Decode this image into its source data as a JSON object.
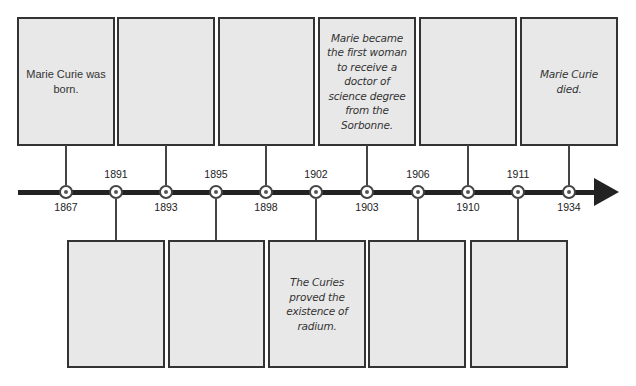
{
  "timeline": {
    "axis_color": "#222222",
    "box_fill": "#e8e8e8",
    "box_border": "#333333",
    "nodes": [
      {
        "year": "1867",
        "label_position": "below",
        "x": 66
      },
      {
        "year": "1891",
        "label_position": "above",
        "x": 116
      },
      {
        "year": "1893",
        "label_position": "below",
        "x": 166
      },
      {
        "year": "1895",
        "label_position": "above",
        "x": 216
      },
      {
        "year": "1898",
        "label_position": "below",
        "x": 266
      },
      {
        "year": "1902",
        "label_position": "above",
        "x": 316
      },
      {
        "year": "1903",
        "label_position": "below",
        "x": 367
      },
      {
        "year": "1906",
        "label_position": "above",
        "x": 418
      },
      {
        "year": "1910",
        "label_position": "below",
        "x": 468
      },
      {
        "year": "1911",
        "label_position": "above",
        "x": 518
      },
      {
        "year": "1934",
        "label_position": "below",
        "x": 569
      }
    ],
    "top_boxes": [
      {
        "year": "1867",
        "text": "Marie Curie was born.",
        "style": "print"
      },
      {
        "year": "1893",
        "text": "",
        "style": "print"
      },
      {
        "year": "1898",
        "text": "",
        "style": "print"
      },
      {
        "year": "1903",
        "text": "Marie became the first woman to receive a doctor of science degree from the Sorbonne.",
        "style": "hand"
      },
      {
        "year": "1910",
        "text": "",
        "style": "print"
      },
      {
        "year": "1934",
        "text": "Marie Curie died.",
        "style": "hand"
      }
    ],
    "bottom_boxes": [
      {
        "year": "1891",
        "text": "",
        "style": "print"
      },
      {
        "year": "1895",
        "text": "",
        "style": "print"
      },
      {
        "year": "1902",
        "text": "The Curies proved the existence of radium.",
        "style": "hand"
      },
      {
        "year": "1906",
        "text": "",
        "style": "print"
      },
      {
        "year": "1911",
        "text": "",
        "style": "print"
      }
    ]
  }
}
